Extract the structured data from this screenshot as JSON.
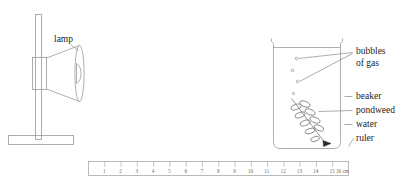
{
  "figure": {
    "background_color": "#ffffff",
    "line_color": "#9a9a9a",
    "text_color": "#1d1d1d"
  },
  "lamp": {
    "label": "lamp",
    "parts": [
      "stand-rod",
      "stand-base",
      "lamp-body",
      "lamp-shade",
      "bulb"
    ]
  },
  "beaker": {
    "labels": {
      "bubbles": "bubbles",
      "bubbles_line2": "of gas",
      "beaker": "beaker",
      "pondweed": "pondweed",
      "water": "water",
      "ruler": "ruler"
    },
    "bubble_count": 4,
    "contents": [
      "water",
      "pondweed",
      "bubbles of gas"
    ]
  },
  "ruler": {
    "unit_label": "16 cm",
    "ticks": [
      "1",
      "2",
      "3",
      "4",
      "5",
      "6",
      "7",
      "8",
      "9",
      "10",
      "11",
      "12",
      "13",
      "14",
      "15"
    ],
    "max_value": 16
  }
}
